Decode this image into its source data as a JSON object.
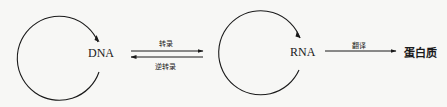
{
  "diagram": {
    "nodes": [
      {
        "id": "dna",
        "label": "DNA"
      },
      {
        "id": "rna",
        "label": "RNA"
      },
      {
        "id": "protein",
        "label": "蛋白质"
      }
    ],
    "edges": {
      "transcription": {
        "from": "DNA",
        "to": "RNA",
        "label": "转录"
      },
      "reverse_transcription": {
        "from": "RNA",
        "to": "DNA",
        "label": "逆转录"
      },
      "translation": {
        "from": "RNA",
        "to": "蛋白质",
        "label": "翻译"
      }
    },
    "self_loops": [
      {
        "node": "DNA",
        "meaning": "replication-cycle"
      },
      {
        "node": "RNA",
        "meaning": "replication-cycle"
      }
    ],
    "colors": {
      "stroke": "#1a1a1a",
      "background": "#f7f7f5"
    }
  }
}
